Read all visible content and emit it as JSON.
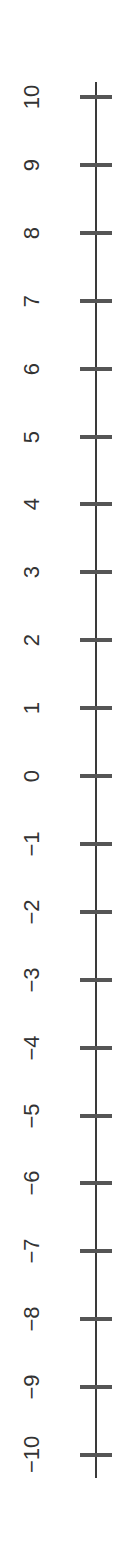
{
  "chart_data": {
    "type": "number-line",
    "orientation": "vertical",
    "min": -10,
    "max": 10,
    "step": 1,
    "ticks": [
      10,
      9,
      8,
      7,
      6,
      5,
      4,
      3,
      2,
      1,
      0,
      -1,
      -2,
      -3,
      -4,
      -5,
      -6,
      -7,
      -8,
      -9,
      -10
    ],
    "tick_labels": [
      "10",
      "9",
      "8",
      "7",
      "6",
      "5",
      "4",
      "3",
      "2",
      "1",
      "0",
      "−1",
      "−2",
      "−3",
      "−4",
      "−5",
      "−6",
      "−7",
      "−8",
      "−9",
      "−10"
    ],
    "label_rotation_deg": -90,
    "title": "",
    "xlabel": "",
    "ylabel": ""
  },
  "layout": {
    "top_tick_y": 97,
    "bottom_tick_y": 1455,
    "line_top_y": 82,
    "line_bottom_y": 1478
  },
  "colors": {
    "line": "#3a3a3a",
    "tick": "#555555",
    "label": "#333333",
    "background": "#ffffff"
  }
}
